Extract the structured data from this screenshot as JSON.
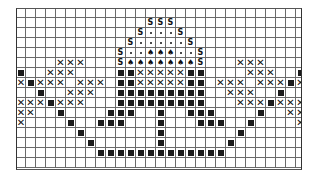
{
  "pattern": {
    "title": "",
    "columns": 29,
    "rows": 16,
    "legend": {
      ".": {
        "name": "empty",
        "glyph": ""
      },
      "S": {
        "name": "s-stitch",
        "glyph": "S"
      },
      "o": {
        "name": "dot-stitch",
        "glyph": "•"
      },
      "H": {
        "name": "spade-stitch",
        "glyph": "♠"
      },
      "X": {
        "name": "cross-stitch",
        "glyph": "✕"
      },
      "#": {
        "name": "filled-square-stitch",
        "glyph": "■"
      }
    },
    "grid": [
      ".............................",
      ".............SSS.............",
      "............SoooS............",
      "...........SoooooS...........",
      "..........SooHHHooS..........",
      "....XXX...SHHHHHHHS...XXX....",
      "#..XXX....##XXXXX##....XXX..#",
      "X#XXX.XXX.##XXXXX##.XXX.XXX#X",
      "..#..XXX..#########..XXX..#..",
      "XXX#XXX...#########...XXX#XXX",
      "XX..#....###..#..###....#..XX",
      "X....#..###...#...###..#....X",
      "......#.......#.......#......",
      ".......#......#......#.......",
      "........#############........",
      "............................."
    ],
    "colors": {
      "grid_line": "#6a6a6a",
      "symbol": "#1a1a1a",
      "background": "#ffffff"
    }
  }
}
